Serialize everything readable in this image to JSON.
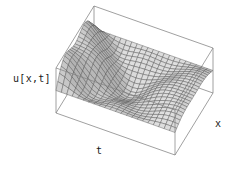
{
  "figure": {
    "kind": "surface-plot-3d",
    "background_color": "#ffffff",
    "mesh_line_color": "#4d4d4d",
    "box_line_color": "#808080",
    "shade_light": "#e0e0e0",
    "shade_dark": "#8c8c8c"
  },
  "labels": {
    "vertical_axis": "u[x,t]",
    "depth_axis": "t",
    "horizontal_axis": "x"
  },
  "chart_data": {
    "type": "surface",
    "title": "",
    "xlabel": "x",
    "ylabel": "t",
    "zlabel": "u[x,t]",
    "grid": false,
    "legend": null,
    "xlim": [
      0,
      1
    ],
    "ylim": [
      0,
      1
    ],
    "zlim": [
      -1,
      1
    ],
    "x_ticks": [],
    "y_ticks": [],
    "z_ticks": [],
    "nx": 22,
    "ny": 22,
    "surface_function": "u(x,t) = sin(pi*x) * cos(2.1*pi*t) * exp(-1.15*t) + 0.30*sin(3*pi*x)*cos(4.2*pi*t)*exp(-1.6*t)",
    "projection": {
      "type": "axonometric",
      "box_corners_px": {
        "left": [
          56,
          68
        ],
        "left_bottom": [
          56,
          113
        ],
        "front_bottom": [
          175,
          155
        ],
        "right_bottom": [
          213,
          93
        ],
        "right_top": [
          213,
          40
        ],
        "back_top": [
          150,
          14
        ]
      }
    },
    "shading": {
      "model": "lambertian-grayscale",
      "light_direction": [
        -0.45,
        -0.35,
        0.82
      ],
      "ambient": 0.42
    }
  }
}
